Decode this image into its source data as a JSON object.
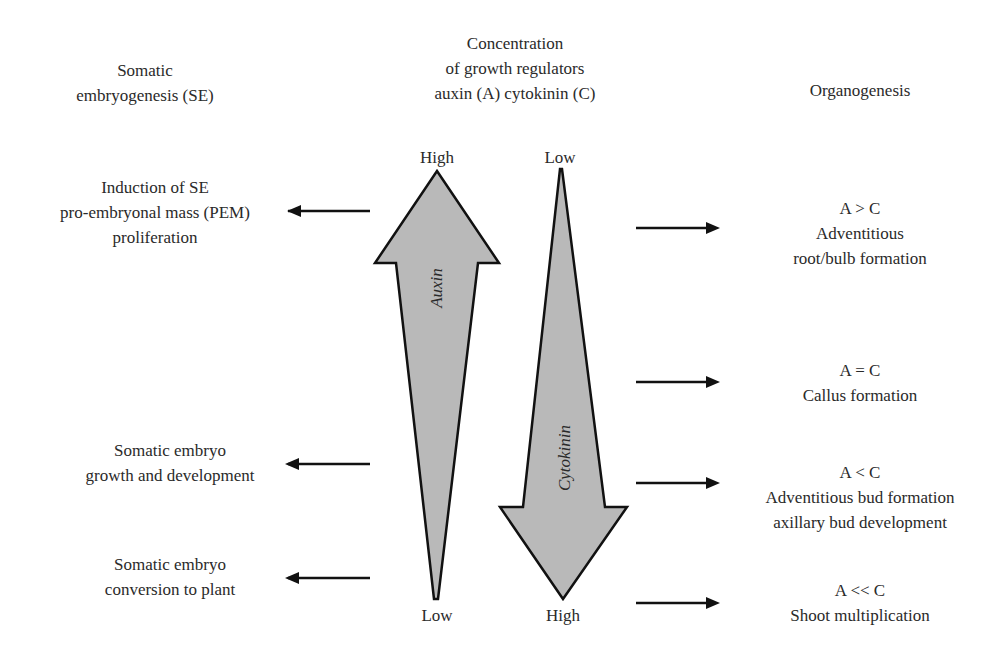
{
  "headers": {
    "left": [
      "Somatic",
      "embryogenesis (SE)"
    ],
    "center": [
      "Concentration",
      "of growth regulators",
      "auxin (A) cytokinin (C)"
    ],
    "right": [
      "Organogenesis"
    ]
  },
  "auxin_arrow": {
    "label": "Auxin",
    "top_label": "High",
    "bottom_label": "Low",
    "direction": "up"
  },
  "cytokinin_arrow": {
    "label": "Cytokinin",
    "top_label": "Low",
    "bottom_label": "High",
    "direction": "down"
  },
  "left_items": [
    {
      "lines": [
        "Induction of SE",
        "pro-embryonal mass (PEM)",
        "proliferation"
      ]
    },
    {
      "lines": [
        "Somatic embryo",
        "growth and development"
      ]
    },
    {
      "lines": [
        "Somatic embryo",
        "conversion to plant"
      ]
    }
  ],
  "right_items": [
    {
      "lines": [
        "A > C",
        "Adventitious",
        "root/bulb formation"
      ]
    },
    {
      "lines": [
        "A = C",
        "Callus formation"
      ]
    },
    {
      "lines": [
        "A < C",
        "Adventitious bud formation",
        "axillary bud development"
      ]
    },
    {
      "lines": [
        "A << C",
        "Shoot multiplication"
      ]
    }
  ],
  "colors": {
    "arrow_fill": "#b9b9b9",
    "stroke": "#111111",
    "text": "#2a2a2a"
  }
}
